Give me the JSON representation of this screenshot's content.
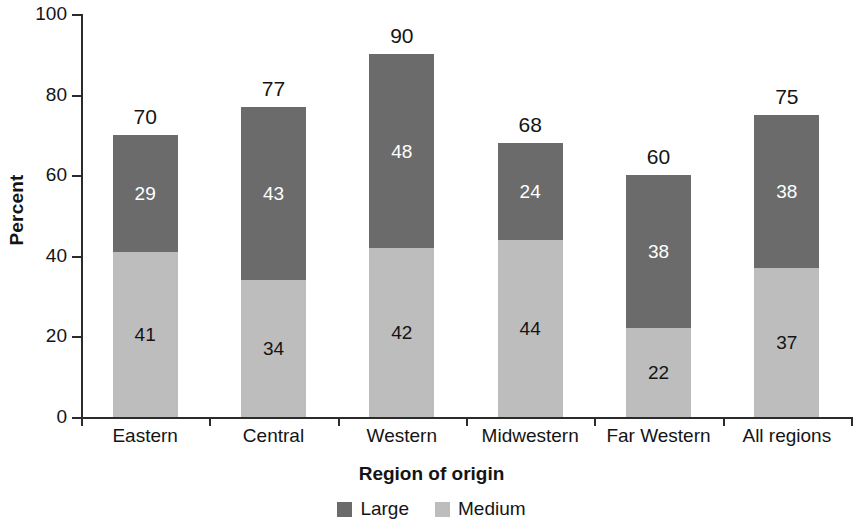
{
  "chart_data": {
    "type": "bar",
    "subtype": "stacked-vertical",
    "title": "",
    "xlabel": "Region of origin",
    "ylabel": "Percent",
    "ylim": [
      0,
      100
    ],
    "yticks": [
      0,
      20,
      40,
      60,
      80,
      100
    ],
    "ytick_labels": [
      "0",
      "20",
      "40",
      "60",
      "80",
      "100"
    ],
    "grid": false,
    "legend_position": "bottom-center",
    "categories": [
      "Eastern",
      "Central",
      "Western",
      "Midwestern",
      "Far Western",
      "All regions"
    ],
    "series": [
      {
        "name": "Large",
        "color": "#6b6b6b",
        "label_color": "#ffffff",
        "values": [
          29,
          43,
          48,
          24,
          38,
          38
        ]
      },
      {
        "name": "Medium",
        "color": "#bdbdbd",
        "label_color": "#141414",
        "values": [
          41,
          34,
          42,
          44,
          22,
          37
        ]
      }
    ],
    "stack_order_bottom_to_top": [
      "Medium",
      "Large"
    ],
    "totals": [
      70,
      77,
      90,
      68,
      60,
      75
    ],
    "total_label_color": "#141414",
    "axis_color": "#2b2b2b",
    "background": "#ffffff"
  },
  "legend": {
    "items": [
      {
        "label": "Large",
        "color": "#6b6b6b"
      },
      {
        "label": "Medium",
        "color": "#bdbdbd"
      }
    ]
  }
}
